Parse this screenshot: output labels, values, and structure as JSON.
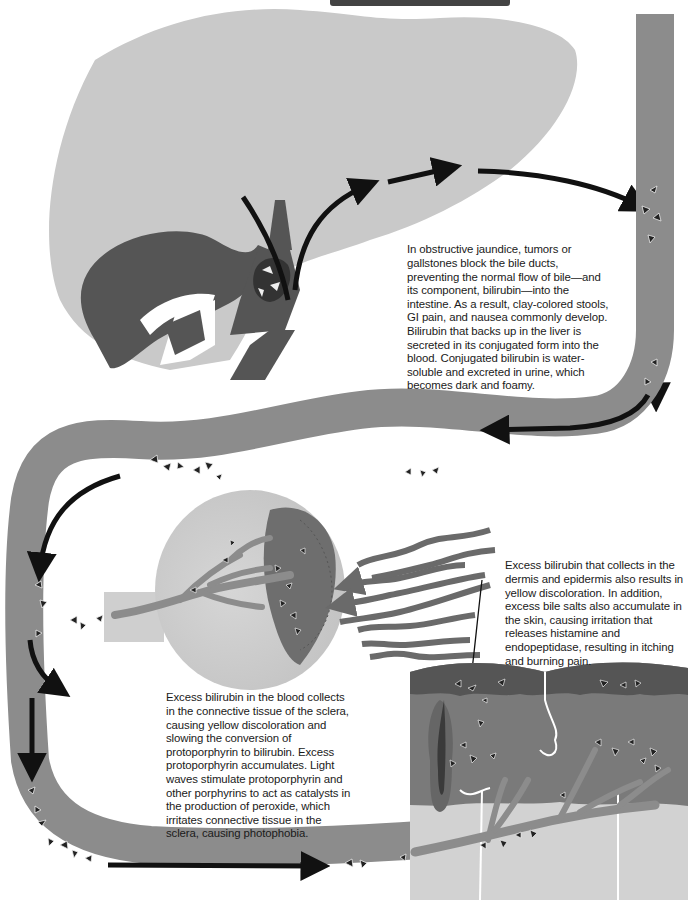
{
  "diagram": {
    "title_visible": false,
    "colors": {
      "liver": "#c9c9c9",
      "gallbladder_duct": "#555555",
      "vessel": "#8c8c8c",
      "arrow": "#111111",
      "sclera": "#cfcfcf",
      "iris": "#6e6e6e",
      "epidermis": "#5a5a5a",
      "dermis": "#7a7a7a",
      "subcutis": "#d2d2d2",
      "light_waves": "#6a6a6a"
    },
    "regions": [
      {
        "id": "liver",
        "label": "Liver"
      },
      {
        "id": "gallbladder",
        "label": "Gallbladder and bile ducts"
      },
      {
        "id": "blood-vessel",
        "label": "Blood vessel carrying bilirubin"
      },
      {
        "id": "eye",
        "label": "Eye / sclera"
      },
      {
        "id": "skin",
        "label": "Skin cross-section"
      }
    ]
  },
  "captions": {
    "obstructive": "In obstructive jaundice, tumors or gallstones block the bile ducts, preventing the normal flow of bile—and its component, bilirubin—into the intestine. As a result, clay-colored stools, GI pain, and nausea commonly develop. Bilirubin that backs up in the liver is secreted in its conjugated form into the blood. Conjugated bilirubin is water-soluble and excreted in urine, which becomes dark and foamy.",
    "skin": "Excess bilirubin that collects in the dermis and epidermis also results in yellow discoloration. In addition, excess bile salts also accumulate in the skin, causing irritation that releases histamine and endopeptidase, resulting in itching and burning pain.",
    "sclera": "Excess bilirubin in the blood collects in the connective tissue of the sclera, causing yellow discoloration and slowing the conversion of protoporphyrin to bilirubin. Excess protoporphyrin accumulates. Light waves stimulate protoporphyrin and other porphyrins to act as catalysts in the production of peroxide, which irritates connective tissue in the sclera, causing photophobia."
  }
}
